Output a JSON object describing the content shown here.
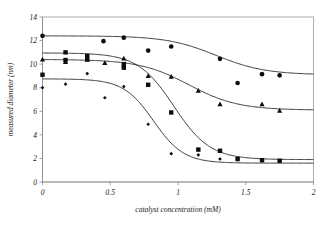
{
  "chart_data": {
    "type": "scatter",
    "title": "",
    "xlabel": "catalyst concentration (mM)",
    "ylabel": "measured diameter (nm)",
    "xlim": [
      0,
      2
    ],
    "ylim": [
      0,
      14
    ],
    "xticks": [
      0,
      0.5,
      1,
      1.5,
      2
    ],
    "xtick_labels": [
      "0",
      "0.5",
      "1",
      "1.5",
      "2"
    ],
    "yticks": [
      0,
      2,
      4,
      6,
      8,
      10,
      12,
      14
    ],
    "ytick_labels": [
      "0",
      "2",
      "4",
      "6",
      "8",
      "10",
      "12",
      "14"
    ],
    "grid": false,
    "legend": "none",
    "series": [
      {
        "name": "series-circle",
        "marker": "circle",
        "top_plateau": 12.4,
        "bottom_plateau": 9.1,
        "midpoint": 1.28,
        "hill_slope": 5.5,
        "points": [
          {
            "x": 0.0,
            "y": 12.4
          },
          {
            "x": 0.45,
            "y": 11.95
          },
          {
            "x": 0.6,
            "y": 12.25
          },
          {
            "x": 0.78,
            "y": 11.15
          },
          {
            "x": 0.95,
            "y": 11.5
          },
          {
            "x": 1.31,
            "y": 10.45
          },
          {
            "x": 1.44,
            "y": 8.4
          },
          {
            "x": 1.62,
            "y": 9.15
          },
          {
            "x": 1.75,
            "y": 9.05
          }
        ]
      },
      {
        "name": "series-triangle",
        "marker": "triangle",
        "top_plateau": 10.4,
        "bottom_plateau": 6.1,
        "midpoint": 1.08,
        "hill_slope": 5.5,
        "points": [
          {
            "x": 0.0,
            "y": 10.4
          },
          {
            "x": 0.17,
            "y": 10.2
          },
          {
            "x": 0.33,
            "y": 10.4
          },
          {
            "x": 0.46,
            "y": 10.1
          },
          {
            "x": 0.6,
            "y": 10.5
          },
          {
            "x": 0.78,
            "y": 9.0
          },
          {
            "x": 0.95,
            "y": 8.95
          },
          {
            "x": 1.15,
            "y": 7.75
          },
          {
            "x": 1.31,
            "y": 6.6
          },
          {
            "x": 1.62,
            "y": 6.6
          },
          {
            "x": 1.75,
            "y": 6.05
          }
        ]
      },
      {
        "name": "series-square",
        "marker": "square",
        "top_plateau": 10.95,
        "bottom_plateau": 1.9,
        "midpoint": 0.97,
        "hill_slope": 7.5,
        "points": [
          {
            "x": 0.0,
            "y": 9.1
          },
          {
            "x": 0.17,
            "y": 11.0
          },
          {
            "x": 0.17,
            "y": 10.35
          },
          {
            "x": 0.33,
            "y": 10.7
          },
          {
            "x": 0.33,
            "y": 10.4
          },
          {
            "x": 0.6,
            "y": 10.0
          },
          {
            "x": 0.6,
            "y": 9.7
          },
          {
            "x": 0.78,
            "y": 8.25
          },
          {
            "x": 0.95,
            "y": 5.9
          },
          {
            "x": 1.15,
            "y": 2.75
          },
          {
            "x": 1.31,
            "y": 2.65
          },
          {
            "x": 1.44,
            "y": 1.95
          },
          {
            "x": 1.62,
            "y": 1.85
          },
          {
            "x": 1.75,
            "y": 1.8
          }
        ]
      },
      {
        "name": "series-diamond",
        "marker": "diamond",
        "top_plateau": 8.75,
        "bottom_plateau": 1.6,
        "midpoint": 0.82,
        "hill_slope": 9.0,
        "points": [
          {
            "x": 0.0,
            "y": 8.0
          },
          {
            "x": 0.17,
            "y": 8.3
          },
          {
            "x": 0.33,
            "y": 9.2
          },
          {
            "x": 0.46,
            "y": 7.15
          },
          {
            "x": 0.6,
            "y": 8.1
          },
          {
            "x": 0.78,
            "y": 4.9
          },
          {
            "x": 0.95,
            "y": 2.4
          },
          {
            "x": 1.15,
            "y": 2.3
          },
          {
            "x": 1.31,
            "y": 1.95
          },
          {
            "x": 1.44,
            "y": 1.9
          },
          {
            "x": 1.62,
            "y": 1.8
          },
          {
            "x": 1.75,
            "y": 1.8
          }
        ]
      }
    ]
  },
  "colors": {
    "marker": "#0d0d0d",
    "curve": "#1a1a1a",
    "axis": "#8a8a8a",
    "frame": "#9a9a9a",
    "background": "#ffffff"
  }
}
